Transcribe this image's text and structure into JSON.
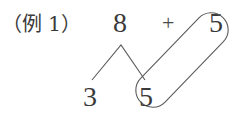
{
  "example_label": "（例 1）",
  "expression": {
    "left_operand": "8",
    "operator": "+",
    "right_operand": "5"
  },
  "decomposition": {
    "of": "8",
    "parts": [
      "3",
      "5"
    ]
  },
  "grouping": {
    "description": "capsule enclosing the decomposed 5 and the added 5",
    "members": [
      "5",
      "5"
    ]
  },
  "colors": {
    "ink": "#3a3a3a",
    "line": "#5a5a5a",
    "background": "#ffffff"
  }
}
